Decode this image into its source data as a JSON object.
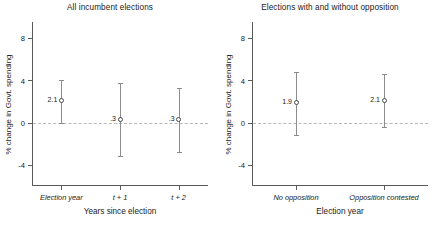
{
  "chart_data": [
    {
      "type": "scatter",
      "title": "All incumbent elections",
      "xlabel": "Years since election",
      "ylabel": "% change in Govt. spending",
      "categories": [
        "Election year",
        "t + 1",
        "t + 2"
      ],
      "values": [
        2.1,
        0.3,
        0.3
      ],
      "data_labels": [
        "2.1",
        ".3",
        ".3"
      ],
      "ci_low": [
        0.0,
        -3.2,
        -2.8
      ],
      "ci_high": [
        4.0,
        3.7,
        3.3
      ],
      "yticks": [
        "8",
        "4",
        "0",
        "-4"
      ],
      "ytick_values": [
        8,
        4,
        0,
        -4
      ],
      "ylim": [
        -6,
        9.5
      ],
      "reference_line": 0,
      "grid": false,
      "legend": "none",
      "marker": "open-circle",
      "error_bars": "95% confidence interval"
    },
    {
      "type": "scatter",
      "title": "Elections with and without opposition",
      "xlabel": "Election year",
      "ylabel": "% change in Govt. spending",
      "categories": [
        "No opposition",
        "Opposition contested"
      ],
      "values": [
        1.9,
        2.1
      ],
      "data_labels": [
        "1.9",
        "2.1"
      ],
      "ci_low": [
        -1.2,
        -0.4
      ],
      "ci_high": [
        4.8,
        4.6
      ],
      "yticks": [
        "8",
        "4",
        "0",
        "-4"
      ],
      "ytick_values": [
        8,
        4,
        0,
        -4
      ],
      "ylim": [
        -6,
        9.5
      ],
      "reference_line": 0,
      "grid": false,
      "legend": "none",
      "marker": "open-circle",
      "error_bars": "95% confidence interval"
    }
  ],
  "colors": {
    "axis": "#5a5a5a",
    "whisker": "#8c8c8c",
    "marker_edge": "#4a4a4a",
    "zero_line": "#b9b9b9",
    "text": "#1a1a1a",
    "background": "#ffffff"
  }
}
